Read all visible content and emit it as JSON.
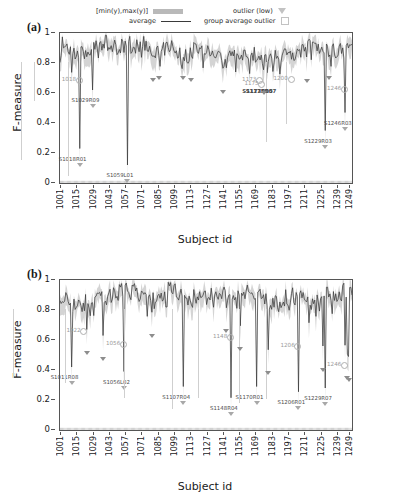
{
  "legend": {
    "range_label": "[min(y),max(y)]",
    "average_label": "average",
    "outlier_label": "outlier (low)",
    "group_outlier_label": "group average outlier",
    "band_color": "#b9b9b9",
    "line_color": "#3a3a3a",
    "marker_color": "#c2c2c2"
  },
  "panels": [
    {
      "tag": "(a)",
      "ylabel": "F-measure",
      "xlabel": "Subject id",
      "yticks": [
        "0",
        "0.2",
        "0.4",
        "0.6",
        "0.8",
        "1"
      ],
      "xticks": [
        "1001",
        "1015",
        "1029",
        "1043",
        "1057",
        "1071",
        "1085",
        "1099",
        "1113",
        "1127",
        "1141",
        "1155",
        "1169",
        "1183",
        "1197",
        "1211",
        "1225",
        "1239",
        "1249"
      ],
      "subject_outliers": [
        {
          "label": "S1018R01",
          "x": 1018,
          "y": 0.13
        },
        {
          "label": "S1029R09",
          "x": 1029,
          "y": 0.52
        },
        {
          "label": "S1059L01",
          "x": 1059,
          "y": 0.02
        },
        {
          "label": "S1229R03",
          "x": 1229,
          "y": 0.25
        },
        {
          "label": "S1246R03",
          "x": 1246,
          "y": 0.37
        }
      ],
      "group_outliers": [
        {
          "label": "1018",
          "x": 1018,
          "y": 0.68
        },
        {
          "label": "1173",
          "x": 1173,
          "y": 0.68
        },
        {
          "label": "1175",
          "x": 1175,
          "y": 0.655
        },
        {
          "label": "1200",
          "x": 1200,
          "y": 0.685
        },
        {
          "label": "1246",
          "x": 1246,
          "y": 0.62
        }
      ],
      "crowded_labels": [
        {
          "label": "S1173R05",
          "x": 1174,
          "y": 0.625
        },
        {
          "label": "S1175R07",
          "x": 1177,
          "y": 0.625
        }
      ],
      "plain_outliers": [
        {
          "x": 1081,
          "y": 0.695
        },
        {
          "x": 1086,
          "y": 0.705
        },
        {
          "x": 1107,
          "y": 0.705
        },
        {
          "x": 1114,
          "y": 0.695
        },
        {
          "x": 1141,
          "y": 0.615
        },
        {
          "x": 1176,
          "y": 0.605
        },
        {
          "x": 1213,
          "y": 0.69
        },
        {
          "x": 1232,
          "y": 0.705
        }
      ]
    },
    {
      "tag": "(b)",
      "ylabel": "F-measure",
      "xlabel": "Subject id",
      "yticks": [
        "0",
        "0.2",
        "0.4",
        "0.6",
        "0.8",
        "1"
      ],
      "xticks": [
        "1001",
        "1015",
        "1029",
        "1043",
        "1057",
        "1071",
        "1085",
        "1099",
        "1113",
        "1127",
        "1141",
        "1155",
        "1169",
        "1183",
        "1197",
        "1211",
        "1225",
        "1239",
        "1249"
      ],
      "subject_outliers": [
        {
          "label": "S1011R08",
          "x": 1011,
          "y": 0.32
        },
        {
          "label": "S1056L02",
          "x": 1056,
          "y": 0.29
        },
        {
          "label": "S1107R04",
          "x": 1107,
          "y": 0.19
        },
        {
          "label": "S1148R04",
          "x": 1148,
          "y": 0.115
        },
        {
          "label": "S1170R01",
          "x": 1170,
          "y": 0.19
        },
        {
          "label": "S1206R01",
          "x": 1206,
          "y": 0.155
        },
        {
          "label": "S1229R07",
          "x": 1229,
          "y": 0.18
        }
      ],
      "group_outliers": [
        {
          "label": "1022",
          "x": 1022,
          "y": 0.655
        },
        {
          "label": "1056",
          "x": 1056,
          "y": 0.565
        },
        {
          "label": "1148",
          "x": 1148,
          "y": 0.615
        },
        {
          "label": "1206",
          "x": 1206,
          "y": 0.555
        },
        {
          "label": "1246",
          "x": 1246,
          "y": 0.425
        }
      ],
      "crowded_labels": [],
      "plain_outliers": [
        {
          "x": 1024,
          "y": 0.52
        },
        {
          "x": 1038,
          "y": 0.48
        },
        {
          "x": 1080,
          "y": 0.635
        },
        {
          "x": 1144,
          "y": 0.665
        },
        {
          "x": 1156,
          "y": 0.545
        },
        {
          "x": 1180,
          "y": 0.385
        },
        {
          "x": 1227,
          "y": 0.41
        },
        {
          "x": 1248,
          "y": 0.355
        },
        {
          "x": 1249,
          "y": 0.34
        }
      ]
    }
  ],
  "chart_data": {
    "type": "line",
    "title": "",
    "xlabel": "Subject id",
    "ylabel": "F-measure",
    "xlim": [
      1001,
      1252
    ],
    "ylim": [
      0,
      1
    ],
    "grid": false,
    "legend_position": "top",
    "series": [
      {
        "name": "average",
        "panel": "(a)",
        "description": "Per-subject average F-measure, dense oscillation mostly between 0.78 and 0.99 with sharp downward spikes at outlier subjects",
        "x": [
          1001,
          1005,
          1009,
          1013,
          1018,
          1022,
          1026,
          1029,
          1033,
          1037,
          1041,
          1045,
          1049,
          1053,
          1057,
          1059,
          1063,
          1067,
          1071,
          1075,
          1079,
          1083,
          1087,
          1091,
          1095,
          1099,
          1103,
          1107,
          1111,
          1115,
          1119,
          1123,
          1127,
          1131,
          1135,
          1139,
          1143,
          1147,
          1151,
          1155,
          1159,
          1163,
          1167,
          1171,
          1175,
          1179,
          1183,
          1187,
          1191,
          1195,
          1199,
          1203,
          1207,
          1211,
          1215,
          1219,
          1223,
          1227,
          1231,
          1235,
          1239,
          1243,
          1247,
          1251
        ],
        "y": [
          0.9,
          0.86,
          0.93,
          0.84,
          0.77,
          0.95,
          0.88,
          0.8,
          0.92,
          0.86,
          0.94,
          0.88,
          0.83,
          0.95,
          0.9,
          0.8,
          0.93,
          0.86,
          0.91,
          0.88,
          0.94,
          0.82,
          0.92,
          0.89,
          0.93,
          0.86,
          0.91,
          0.84,
          0.93,
          0.88,
          0.9,
          0.86,
          0.92,
          0.88,
          0.84,
          0.91,
          0.88,
          0.93,
          0.86,
          0.9,
          0.88,
          0.92,
          0.85,
          0.91,
          0.83,
          0.9,
          0.93,
          0.88,
          0.92,
          0.86,
          0.91,
          0.89,
          0.93,
          0.87,
          0.92,
          0.9,
          0.94,
          0.81,
          0.92,
          0.89,
          0.93,
          0.86,
          0.78,
          0.96
        ]
      },
      {
        "name": "average",
        "panel": "(b)",
        "description": "Per-subject average F-measure for panel b, similar oscillation band 0.78-0.99 with deep spikes",
        "x": [
          1001,
          1005,
          1009,
          1013,
          1018,
          1022,
          1026,
          1029,
          1033,
          1037,
          1041,
          1045,
          1049,
          1053,
          1057,
          1059,
          1063,
          1067,
          1071,
          1075,
          1079,
          1083,
          1087,
          1091,
          1095,
          1099,
          1103,
          1107,
          1111,
          1115,
          1119,
          1123,
          1127,
          1131,
          1135,
          1139,
          1143,
          1147,
          1151,
          1155,
          1159,
          1163,
          1167,
          1171,
          1175,
          1179,
          1183,
          1187,
          1191,
          1195,
          1199,
          1203,
          1207,
          1211,
          1215,
          1219,
          1223,
          1227,
          1231,
          1235,
          1239,
          1243,
          1247,
          1251
        ],
        "y": [
          0.89,
          0.91,
          0.87,
          0.92,
          0.8,
          0.96,
          0.86,
          0.9,
          0.93,
          0.88,
          0.91,
          0.86,
          0.93,
          0.89,
          0.76,
          0.92,
          0.88,
          0.93,
          0.9,
          0.87,
          0.92,
          0.89,
          0.94,
          0.9,
          0.92,
          0.88,
          0.93,
          0.8,
          0.91,
          0.89,
          0.93,
          0.87,
          0.92,
          0.9,
          0.88,
          0.93,
          0.86,
          0.91,
          0.79,
          0.9,
          0.93,
          0.88,
          0.82,
          0.92,
          0.9,
          0.86,
          0.94,
          0.9,
          0.93,
          0.88,
          0.92,
          0.85,
          0.74,
          0.91,
          0.93,
          0.89,
          0.92,
          0.88,
          0.9,
          0.83,
          0.86,
          0.94,
          0.79,
          0.97
        ]
      },
      {
        "name": "[min(y),max(y)]",
        "panel": "both",
        "description": "Shaded gray band spanning per-subject minimum to maximum F-measure, max near 0.99-1.0, min dipping to outlier values"
      }
    ]
  }
}
